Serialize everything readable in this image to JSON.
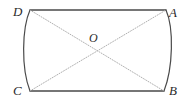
{
  "figure": {
    "type": "geometry-diagram",
    "background_color": "#ffffff",
    "outline_color": "#4a4a4a",
    "diagonal_color": "#b0b0b0",
    "label_color": "#2b2b2b",
    "vertices": [
      {
        "id": "D",
        "label": "D",
        "x": 30,
        "y": 10,
        "corner": "top-left"
      },
      {
        "id": "A",
        "label": "A",
        "x": 166,
        "y": 10,
        "corner": "top-right"
      },
      {
        "id": "B",
        "label": "B",
        "x": 164,
        "y": 91,
        "corner": "bottom-right"
      },
      {
        "id": "C",
        "label": "C",
        "x": 30,
        "y": 91,
        "corner": "bottom-left"
      }
    ],
    "center_point": {
      "id": "O",
      "label": "O",
      "x": 97,
      "y": 50
    },
    "edges": [
      {
        "name": "top-edge",
        "from": "D",
        "to": "A",
        "style": "solid-straight"
      },
      {
        "name": "bottom-edge",
        "from": "C",
        "to": "B",
        "style": "solid-straight"
      },
      {
        "name": "left-edge",
        "from": "D",
        "to": "C",
        "style": "solid-arc-bulging-left"
      },
      {
        "name": "right-edge",
        "from": "A",
        "to": "B",
        "style": "solid-arc-bulging-right"
      }
    ],
    "diagonals": [
      {
        "name": "diagonal-d-b",
        "from": "D",
        "to": "B",
        "style": "dotted"
      },
      {
        "name": "diagonal-c-a",
        "from": "C",
        "to": "A",
        "style": "dotted"
      }
    ]
  }
}
